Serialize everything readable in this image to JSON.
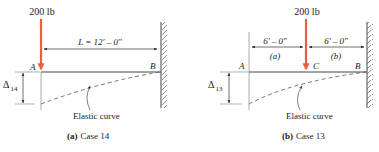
{
  "colors": {
    "load": "#e8603a",
    "line": "#333333",
    "dim": "#555555",
    "curve": "#555555"
  },
  "panel_a": {
    "load_label": "200 lb",
    "span_label": "L = 12' – 0\"",
    "point_a": "A",
    "point_b": "B",
    "delta_symbol": "Δ",
    "delta_subscript": "14",
    "curve_label": "Elastic curve",
    "caption_prefix": "(a)",
    "caption_text": "Case 14"
  },
  "panel_b": {
    "load_label": "200 lb",
    "span_left_label": "6' – 0\"",
    "span_right_label": "6' – 0\"",
    "segment_left": "(a)",
    "segment_right": "(b)",
    "point_a": "A",
    "point_c": "C",
    "point_b": "B",
    "delta_symbol": "Δ",
    "delta_subscript": "13",
    "curve_label": "Elastic curve",
    "caption_prefix": "(b)",
    "caption_text": "Case 13"
  }
}
